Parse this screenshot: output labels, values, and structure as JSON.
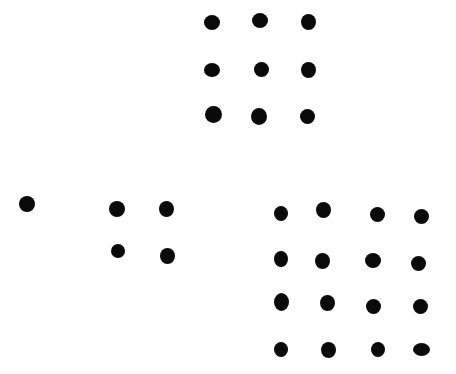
{
  "canvas": {
    "width": 456,
    "height": 374,
    "background": "#ffffff",
    "dot_color": "#0a0a0a"
  },
  "groups": [
    {
      "name": "group-1",
      "count": 1,
      "dots": [
        [
          27,
          204,
          16,
          16
        ]
      ]
    },
    {
      "name": "group-4",
      "count": 4,
      "dots": [
        [
          117,
          209,
          16,
          16
        ],
        [
          166,
          209,
          15,
          16
        ],
        [
          118,
          251,
          14,
          14
        ],
        [
          167,
          256,
          15,
          16
        ]
      ]
    },
    {
      "name": "group-9",
      "count": 9,
      "dots": [
        [
          212,
          22,
          16,
          15
        ],
        [
          260,
          20,
          16,
          15
        ],
        [
          308,
          22,
          15,
          16
        ],
        [
          212,
          70,
          16,
          14
        ],
        [
          261,
          69,
          15,
          15
        ],
        [
          308,
          70,
          15,
          16
        ],
        [
          213,
          114,
          17,
          17
        ],
        [
          259,
          116,
          16,
          17
        ],
        [
          307,
          116,
          15,
          15
        ]
      ]
    },
    {
      "name": "group-16",
      "count": 16,
      "dots": [
        [
          281,
          213,
          14,
          15
        ],
        [
          323,
          210,
          15,
          16
        ],
        [
          377,
          214,
          15,
          15
        ],
        [
          421,
          216,
          15,
          15
        ],
        [
          281,
          259,
          14,
          16
        ],
        [
          322,
          261,
          15,
          16
        ],
        [
          373,
          260,
          16,
          15
        ],
        [
          418,
          263,
          15,
          15
        ],
        [
          281,
          302,
          15,
          18
        ],
        [
          327,
          303,
          15,
          16
        ],
        [
          373,
          306,
          15,
          15
        ],
        [
          420,
          306,
          15,
          15
        ],
        [
          281,
          349,
          14,
          15
        ],
        [
          328,
          350,
          15,
          16
        ],
        [
          378,
          349,
          14,
          15
        ],
        [
          421,
          349,
          17,
          13
        ]
      ]
    }
  ]
}
